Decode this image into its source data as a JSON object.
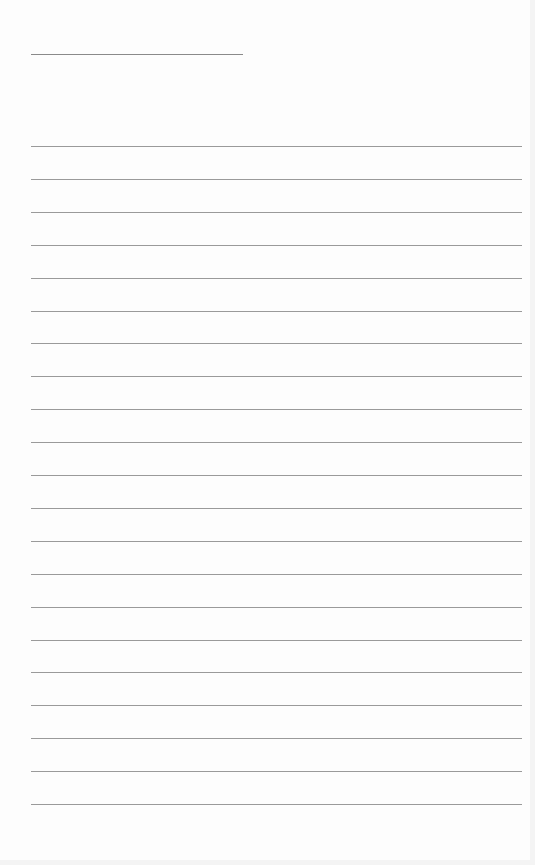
{
  "page": {
    "type": "lined-paper",
    "title_line": {
      "top": 54,
      "left": 31,
      "width": 212
    },
    "rules": {
      "count": 21,
      "first_top": 146,
      "spacing": 32.9,
      "left": 31,
      "width": 491
    },
    "colors": {
      "paper": "#fdfdfd",
      "line": "#9a9a9a"
    }
  }
}
